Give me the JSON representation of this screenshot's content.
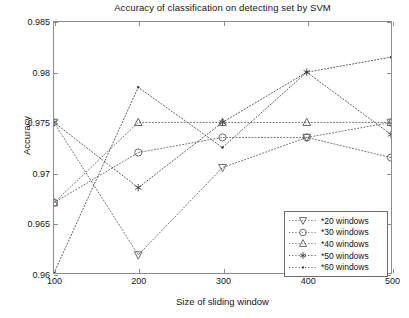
{
  "chart_data": {
    "type": "line",
    "title": "Accuracy of classification on detecting set by SVM",
    "xlabel": "Size of sliding window",
    "ylabel": "Accuracy",
    "x": [
      100,
      200,
      300,
      400,
      500
    ],
    "xlim": [
      100,
      500
    ],
    "ylim": [
      0.96,
      0.985
    ],
    "xticks": [
      "100",
      "200",
      "300",
      "400",
      "500"
    ],
    "yticks": [
      "0.96",
      "0.965",
      "0.97",
      "0.975",
      "0.98",
      "0.985"
    ],
    "grid": false,
    "legend_position": "lower right",
    "line_style": "dotted",
    "series": [
      {
        "name": "*20 windows",
        "marker": "triangle-down",
        "color": "#5a5a5a",
        "values": [
          0.975,
          0.9618,
          0.9705,
          0.9735,
          0.975
        ]
      },
      {
        "name": "*30 windows",
        "marker": "circle",
        "color": "#5a5a5a",
        "values": [
          0.967,
          0.972,
          0.9735,
          0.9735,
          0.9715
        ]
      },
      {
        "name": "*40 windows",
        "marker": "triangle-up",
        "color": "#5a5a5a",
        "values": [
          0.967,
          0.975,
          0.975,
          0.975,
          0.975
        ]
      },
      {
        "name": "*50 windows",
        "marker": "asterisk",
        "color": "#3c3c3c",
        "values": [
          0.975,
          0.9685,
          0.975,
          0.98,
          0.9738
        ]
      },
      {
        "name": "*60 windows",
        "marker": "dot",
        "color": "#3c3c3c",
        "values": [
          0.96,
          0.9785,
          0.9725,
          0.98,
          0.9815
        ]
      }
    ]
  },
  "legend": {
    "items": [
      {
        "label": "*20 windows",
        "marker": "triangle-down"
      },
      {
        "label": "*30 windows",
        "marker": "circle"
      },
      {
        "label": "*40 windows",
        "marker": "triangle-up"
      },
      {
        "label": "*50 windows",
        "marker": "asterisk"
      },
      {
        "label": "*60 windows",
        "marker": "dot"
      }
    ]
  },
  "style": {
    "axis_color": "#8c8c8c",
    "text_color": "#161616",
    "plot_background": "#ffffff"
  }
}
